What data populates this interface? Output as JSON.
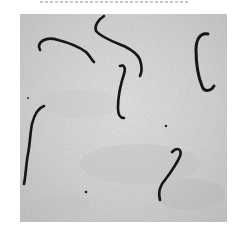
{
  "image": {
    "kind": "scanned grayscale micrograph",
    "background_color": "#d6d6d6",
    "page_margin_color": "#ffffff",
    "filament_color": "#141414",
    "top_caption_partial": "",
    "filaments": [
      {
        "id": 1,
        "shape": "hooked curve, upper-left",
        "path": "M 20 36 C 16 28, 26 22, 38 26 C 50 29, 58 32, 66 38 C 70 42, 72 46, 74 48"
      },
      {
        "id": 2,
        "shape": "bent rod with hook, upper-center",
        "path": "M 84 2 C 78 6, 74 12, 76 17 C 82 24, 94 28, 104 32 C 112 36, 118 40, 120 46 C 122 52, 122 58, 120 62"
      },
      {
        "id": 3,
        "shape": "S-curve, center",
        "path": "M 100 52 C 104 50, 106 54, 104 60 C 100 72, 98 84, 98 94 C 98 100, 100 104, 104 104"
      },
      {
        "id": 4,
        "shape": "C-shape, upper-right",
        "path": "M 188 20 C 180 18, 176 26, 176 36 C 176 50, 178 62, 182 72 C 184 78, 190 78, 194 72"
      },
      {
        "id": 5,
        "shape": "wavy vertical rod, left",
        "path": "M 24 92 C 18 94, 14 102, 12 110 C 10 120, 10 130, 8 140 C 6 150, 6 160, 4 170"
      },
      {
        "id": 6,
        "shape": "hook-topped rod, lower-right",
        "path": "M 152 138 C 158 132, 162 136, 160 142 C 156 152, 148 162, 142 170 C 140 174, 138 178, 140 186"
      },
      {
        "id": 7,
        "shape": "short curl near center",
        "path": "M 100 98 C 102 102, 104 104, 108 104"
      }
    ],
    "debris_dots": [
      {
        "x": 66,
        "y": 178,
        "r": 1.3
      },
      {
        "x": 146,
        "y": 112,
        "r": 1.2
      },
      {
        "x": 8,
        "y": 84,
        "r": 0.9
      }
    ]
  }
}
